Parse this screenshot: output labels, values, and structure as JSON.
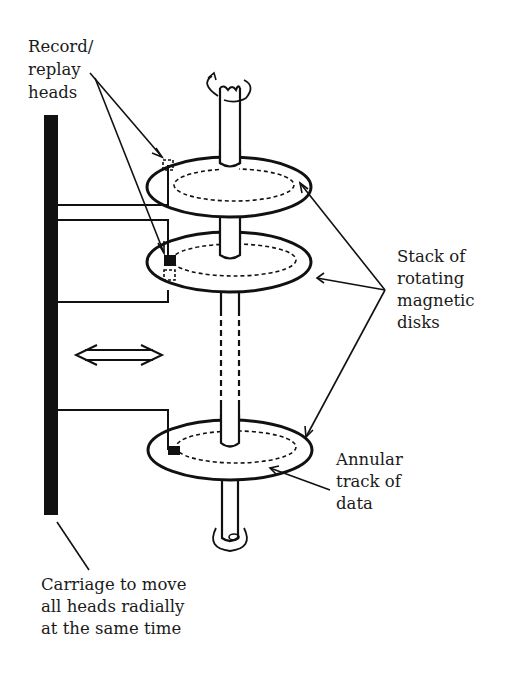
{
  "diagram": {
    "type": "disk-drive-schematic",
    "labels": {
      "heads": [
        "Record/",
        "replay",
        "heads"
      ],
      "disks": [
        "Stack of",
        "rotating",
        "magnetic",
        "disks"
      ],
      "track": [
        "Annular",
        "track of",
        "data"
      ],
      "carriage": [
        "Carriage to move",
        "all heads radially",
        "at the same time"
      ]
    },
    "colors": {
      "ink": "#111111",
      "background": "#ffffff"
    },
    "components": {
      "disk_count_shown": 3,
      "shaft_gap": "dashed (more disks implied)",
      "motion_arrow": "bidirectional horizontal"
    }
  }
}
